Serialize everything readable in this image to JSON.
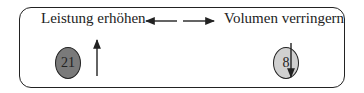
{
  "diagram": {
    "left": {
      "label": "Leistung erhöhen",
      "value": "21",
      "direction": "up",
      "circle_color": "#7a7a7a"
    },
    "right": {
      "label": "Volumen verringern",
      "value": "8",
      "direction": "down",
      "circle_color": "#d0d0d0"
    },
    "connector": "bidirectional-arrows",
    "border_color": "#222222"
  }
}
